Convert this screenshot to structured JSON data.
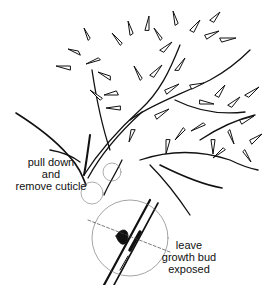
{
  "figure": {
    "colors": {
      "ink": "#111111",
      "background": "#ffffff",
      "guide": "#555555"
    }
  },
  "annotations": {
    "pull_cuticle": {
      "lines": [
        "pull down",
        "and",
        "remove cuticle"
      ]
    },
    "growth_bud": {
      "lines": [
        "leave",
        "growth bud",
        "exposed"
      ]
    }
  }
}
